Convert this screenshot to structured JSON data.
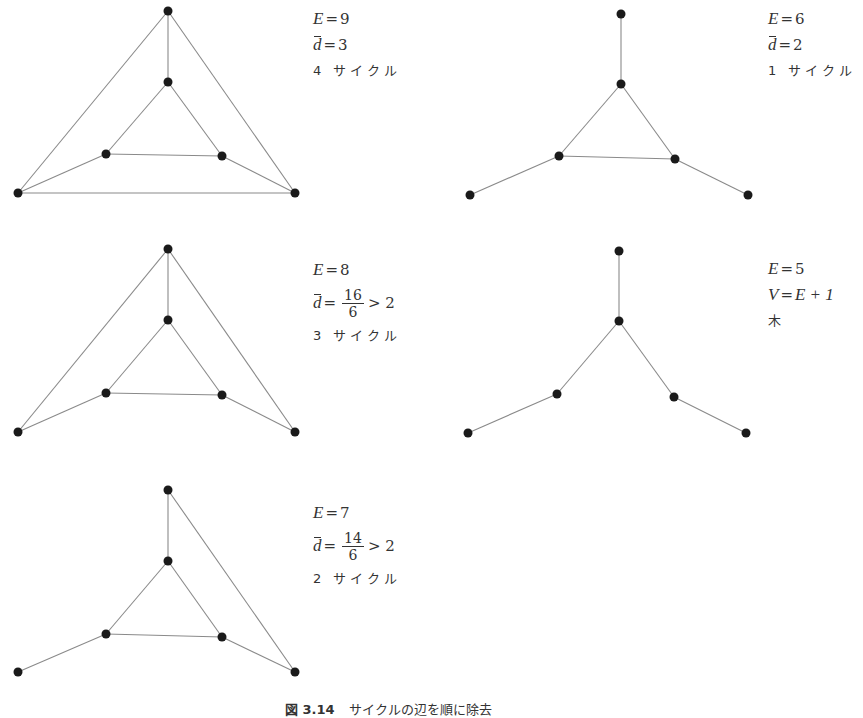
{
  "figure": {
    "caption_number": "図 3.14",
    "caption_text": "サイクルの辺を順に除去"
  },
  "panels": [
    {
      "id": "g1",
      "lines": [
        {
          "lhs": "E",
          "rhs": "9"
        },
        {
          "lhs": "d",
          "bar": true,
          "rhs": "3"
        },
        {
          "text": "4 サイクル"
        }
      ],
      "nodes": [
        [
          168,
          11
        ],
        [
          168,
          82
        ],
        [
          106,
          154
        ],
        [
          222,
          156
        ],
        [
          18,
          193
        ],
        [
          295,
          193
        ]
      ],
      "edges": [
        [
          0,
          1
        ],
        [
          0,
          4
        ],
        [
          0,
          5
        ],
        [
          1,
          2
        ],
        [
          1,
          3
        ],
        [
          2,
          3
        ],
        [
          2,
          4
        ],
        [
          3,
          5
        ],
        [
          4,
          5
        ]
      ]
    },
    {
      "id": "g2",
      "lines": [
        {
          "lhs": "E",
          "rhs": "8"
        },
        {
          "lhs": "d",
          "bar": true,
          "num": "16",
          "den": "6",
          "tail": "> 2"
        },
        {
          "text": "3 サイクル"
        }
      ],
      "nodes": [
        [
          168,
          249
        ],
        [
          168,
          320
        ],
        [
          106,
          393
        ],
        [
          222,
          395
        ],
        [
          18,
          432
        ],
        [
          295,
          432
        ]
      ],
      "edges": [
        [
          0,
          1
        ],
        [
          0,
          4
        ],
        [
          0,
          5
        ],
        [
          1,
          2
        ],
        [
          1,
          3
        ],
        [
          2,
          3
        ],
        [
          2,
          4
        ],
        [
          3,
          5
        ]
      ]
    },
    {
      "id": "g3",
      "lines": [
        {
          "lhs": "E",
          "rhs": "7"
        },
        {
          "lhs": "d",
          "bar": true,
          "num": "14",
          "den": "6",
          "tail": "> 2"
        },
        {
          "text": "2 サイクル"
        }
      ],
      "nodes": [
        [
          168,
          490
        ],
        [
          168,
          561
        ],
        [
          106,
          634
        ],
        [
          222,
          637
        ],
        [
          18,
          672
        ],
        [
          295,
          672
        ]
      ],
      "edges": [
        [
          0,
          1
        ],
        [
          0,
          5
        ],
        [
          1,
          2
        ],
        [
          1,
          3
        ],
        [
          2,
          3
        ],
        [
          2,
          4
        ],
        [
          3,
          5
        ]
      ]
    },
    {
      "id": "g4",
      "lines": [
        {
          "lhs": "E",
          "rhs": "6"
        },
        {
          "lhs": "d",
          "bar": true,
          "rhs": "2"
        },
        {
          "text": "1 サイクル"
        }
      ],
      "nodes": [
        [
          621,
          14
        ],
        [
          621,
          84
        ],
        [
          559,
          156
        ],
        [
          675,
          159
        ],
        [
          470,
          195
        ],
        [
          748,
          195
        ]
      ],
      "edges": [
        [
          0,
          1
        ],
        [
          1,
          2
        ],
        [
          1,
          3
        ],
        [
          2,
          3
        ],
        [
          2,
          4
        ],
        [
          3,
          5
        ]
      ]
    },
    {
      "id": "g5",
      "lines": [
        {
          "lhs": "E",
          "rhs": "5"
        },
        {
          "lhs": "V",
          "rhs": "E + 1"
        },
        {
          "text": "木"
        }
      ],
      "nodes": [
        [
          619,
          251
        ],
        [
          619,
          321
        ],
        [
          557,
          394
        ],
        [
          674,
          397
        ],
        [
          468,
          433
        ],
        [
          746,
          433
        ]
      ],
      "edges": [
        [
          0,
          1
        ],
        [
          1,
          2
        ],
        [
          1,
          3
        ],
        [
          2,
          4
        ],
        [
          3,
          5
        ]
      ]
    }
  ]
}
